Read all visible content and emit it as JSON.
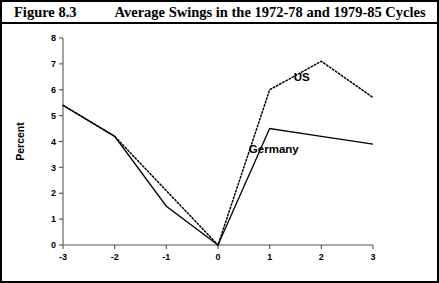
{
  "figure": {
    "number": "Figure 8.3",
    "title": "Average Swings in the 1972-78 and 1979-85 Cycles"
  },
  "chart_data": {
    "type": "line",
    "title": "Average Swings in the 1972-78 and 1979-85 Cycles",
    "xlabel": "",
    "ylabel": "Percent",
    "x": [
      -3,
      -2,
      -1,
      0,
      1,
      2,
      3
    ],
    "xticklabels": [
      "-3",
      "-2",
      "-1",
      "0",
      "1",
      "2",
      "3"
    ],
    "yticklabels": [
      "0",
      "1",
      "2",
      "3",
      "4",
      "5",
      "6",
      "7",
      "8"
    ],
    "xlim": [
      -3,
      3
    ],
    "ylim": [
      0,
      8
    ],
    "grid": false,
    "legend": "inline-annotations",
    "series": [
      {
        "name": "US",
        "label": "US",
        "linestyle": "dotted",
        "color": "#000000",
        "values": [
          5.4,
          4.2,
          2.1,
          0.0,
          6.0,
          7.1,
          5.7
        ]
      },
      {
        "name": "Germany",
        "label": "Germany",
        "linestyle": "solid",
        "color": "#000000",
        "values": [
          5.4,
          4.2,
          1.5,
          0.0,
          4.5,
          4.2,
          3.9
        ]
      }
    ],
    "annotations": [
      {
        "text": "US",
        "x": 1.62,
        "y": 6.35
      },
      {
        "text": "Germany",
        "x": 1.08,
        "y": 3.55
      }
    ]
  }
}
